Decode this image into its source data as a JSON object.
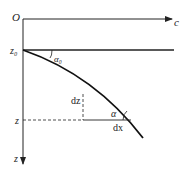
{
  "diagram": {
    "origin_label": "O",
    "x_axis_label": "c",
    "y_axis_label": "z",
    "z0_label": "z₀",
    "z_label": "z",
    "alpha0_label": "α₀",
    "alpha_label": "α",
    "dz_label": "dz",
    "dx_label": "dx",
    "colors": {
      "line": "#222222",
      "background": "#ffffff"
    }
  }
}
